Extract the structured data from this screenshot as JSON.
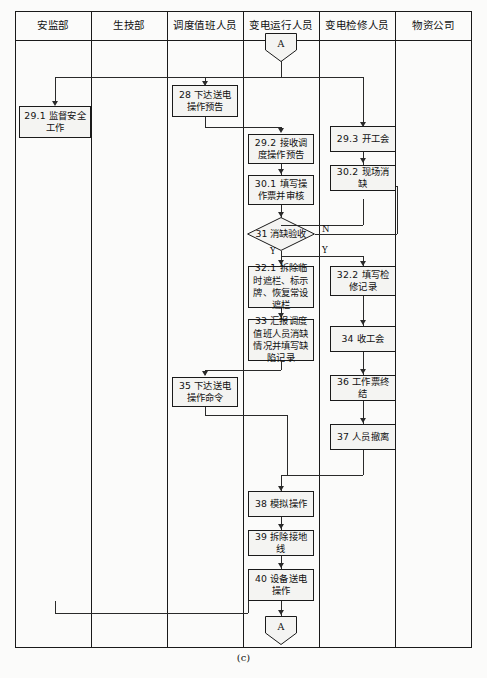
{
  "figure": {
    "caption": "(c)",
    "connector_top_label": "A",
    "connector_bottom_label": "A"
  },
  "lanes": [
    {
      "id": "lane-safety-supervision",
      "label": "安监部"
    },
    {
      "id": "lane-production-tech",
      "label": "生技部"
    },
    {
      "id": "lane-dispatch-duty",
      "label": "调度值班人员"
    },
    {
      "id": "lane-substation-operation",
      "label": "变电运行人员"
    },
    {
      "id": "lane-substation-maintenance",
      "label": "变电检修人员"
    },
    {
      "id": "lane-material-company",
      "label": "物资公司"
    }
  ],
  "nodes": [
    {
      "id": "node-29-1",
      "lane": "安监部",
      "text": "29.1 监督安全工作"
    },
    {
      "id": "node-28",
      "lane": "调度值班人员",
      "text": "28 下达送电操作预告"
    },
    {
      "id": "node-29-2",
      "lane": "变电运行人员",
      "text": "29.2 接收调度操作预告"
    },
    {
      "id": "node-30-1",
      "lane": "变电运行人员",
      "text": "30.1 填写操作票并审核"
    },
    {
      "id": "node-31",
      "lane": "变电运行人员",
      "text": "31 消缺验收",
      "shape": "diamond"
    },
    {
      "id": "node-32-1",
      "lane": "变电运行人员",
      "text": "32.1 拆除临时遮栏、标示牌、恢复常设遮栏"
    },
    {
      "id": "node-33",
      "lane": "变电运行人员",
      "text": "33 汇报调度值班人员消缺情况并填写缺陷记录"
    },
    {
      "id": "node-35",
      "lane": "调度值班人员",
      "text": "35 下达送电操作命令"
    },
    {
      "id": "node-38",
      "lane": "变电运行人员",
      "text": "38 模拟操作"
    },
    {
      "id": "node-39",
      "lane": "变电运行人员",
      "text": "39 拆除接地线"
    },
    {
      "id": "node-40",
      "lane": "变电运行人员",
      "text": "40 设备送电操作"
    },
    {
      "id": "node-29-3",
      "lane": "变电检修人员",
      "text": "29.3 开工会"
    },
    {
      "id": "node-30-2",
      "lane": "变电检修人员",
      "text": "30.2 现场消缺"
    },
    {
      "id": "node-32-2",
      "lane": "变电检修人员",
      "text": "32.2 填写检修记录"
    },
    {
      "id": "node-34",
      "lane": "变电检修人员",
      "text": "34 收工会"
    },
    {
      "id": "node-36",
      "lane": "变电检修人员",
      "text": "36 工作票终结"
    },
    {
      "id": "node-37",
      "lane": "变电检修人员",
      "text": "37 人员撤离"
    }
  ],
  "branch_labels": {
    "decision_no": "N",
    "decision_yes": "Y",
    "decision_yes_right": "Y"
  }
}
